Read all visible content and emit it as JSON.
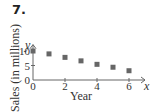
{
  "problem_number": "7.",
  "chart_data": {
    "type": "scatter",
    "title": "",
    "xlabel": "Year",
    "ylabel": "Sales (in millions)",
    "x_axis_var": "x",
    "y_axis_var": "y",
    "x": [
      0,
      1,
      2,
      3,
      4,
      5,
      6
    ],
    "y": [
      10,
      9,
      7.8,
      6.6,
      5.4,
      4.4,
      3.2
    ],
    "x_ticks": [
      "0",
      "2",
      "4",
      "6"
    ],
    "y_ticks": [
      "0",
      "5",
      "10"
    ],
    "xlim": [
      0,
      6.5
    ],
    "ylim": [
      0,
      11.5
    ],
    "grid": false,
    "marker_color": "#666666"
  }
}
